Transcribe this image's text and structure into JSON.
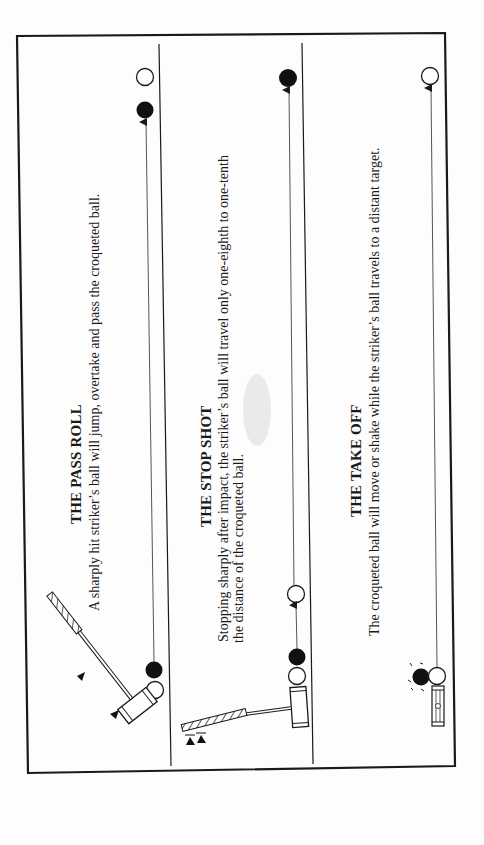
{
  "document": {
    "orientation": "rotated-90-ccw",
    "panels": [
      {
        "id": "pass-roll",
        "title": "THE PASS ROLL",
        "description": "A sharply hit striker’s ball will jump, overtake and pass the croqueted ball."
      },
      {
        "id": "stop-shot",
        "title": "THE STOP SHOT",
        "description_line1": "Stopping sharply after impact, the striker’s ball will travel only one-eighth to one-tenth",
        "description_line2": "the distance of the croqueted ball."
      },
      {
        "id": "take-off",
        "title": "THE TAKE OFF",
        "description": "The croqueted ball will move or shake while the striker’s ball travels to a distant target."
      }
    ],
    "colors": {
      "ink": "#1a1a1a",
      "paper": "#fdfdfd",
      "arrow_line": "#555555"
    }
  }
}
